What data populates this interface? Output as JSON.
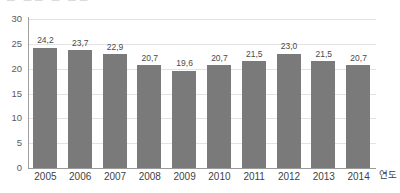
{
  "artifact": {
    "top_cut_text": "▬ ▬▬  ▬ ▬▬"
  },
  "chart_data": {
    "type": "bar",
    "title": "",
    "subtitle": "",
    "xlabel": "연도",
    "ylabel": "",
    "categories": [
      "2005",
      "2006",
      "2007",
      "2008",
      "2009",
      "2010",
      "2011",
      "2012",
      "2013",
      "2014"
    ],
    "values": [
      24.2,
      23.7,
      22.9,
      20.7,
      19.6,
      20.7,
      21.5,
      23.0,
      21.5,
      20.7
    ],
    "value_labels": [
      "24,2",
      "23,7",
      "22,9",
      "20,7",
      "19,6",
      "20,7",
      "21,5",
      "23,0",
      "21,5",
      "20,7"
    ],
    "ylim": [
      0,
      30
    ],
    "yticks": [
      30,
      25,
      20,
      15,
      10,
      5,
      0
    ],
    "ytick_labels": [
      "30",
      "25",
      "20",
      "15",
      "10",
      "5",
      "0"
    ],
    "grid": true,
    "grid_axis": "y",
    "legend": false,
    "legend_position": "none",
    "bar_color": "#7a7a7a",
    "grid_color": "#e3e3e3",
    "axis_color": "#9a9a9a",
    "text_color": "#3f3f3f",
    "background": "#ffffff"
  }
}
